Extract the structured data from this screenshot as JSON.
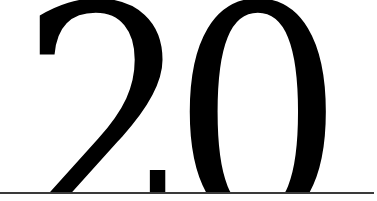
{
  "display": {
    "text": "20",
    "color": "#000000",
    "background": "#ffffff",
    "rule_color": "#3a3a3a"
  }
}
